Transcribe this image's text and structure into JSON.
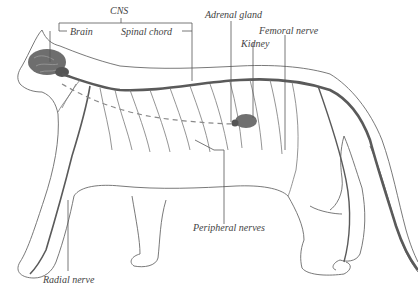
{
  "diagram": {
    "colors": {
      "outline": "#6a6a6a",
      "nerve": "#5a5a5a",
      "brain": "#6e6e6e",
      "kidney": "#707070",
      "label": "#444444",
      "background": "#ffffff"
    },
    "labels": {
      "cns": "CNS",
      "brain": "Brain",
      "spinal_chord": "Spinal chord",
      "adrenal_gland": "Adrenal gland",
      "kidney": "Kidney",
      "femoral_nerve": "Femoral nerve",
      "peripheral_nerves": "Peripheral nerves",
      "radial_nerve": "Radial nerve"
    }
  }
}
